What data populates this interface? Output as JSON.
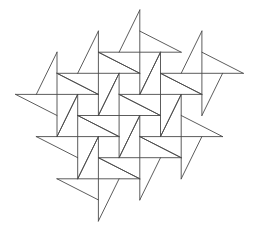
{
  "diagram": {
    "width": 257,
    "height": 237,
    "background": "#ffffff",
    "stroke_color": "#4a4a4a",
    "stroke_width": 0.9,
    "grid": {
      "x0": 15.6,
      "y0": 10.0,
      "ux": 20.7,
      "uy": 21.1
    },
    "pinwheel_centers": [
      [
        6,
        2
      ],
      [
        4,
        3
      ],
      [
        9,
        3
      ],
      [
        2,
        4
      ],
      [
        7,
        4
      ],
      [
        5,
        5
      ],
      [
        3,
        6
      ],
      [
        8,
        6
      ],
      [
        6,
        7
      ],
      [
        4,
        8
      ]
    ]
  }
}
